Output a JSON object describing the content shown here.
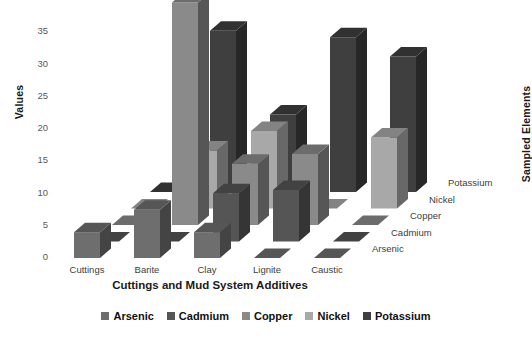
{
  "chart_data": {
    "type": "bar",
    "title": "",
    "subtitle": "",
    "xlabel": "Cuttings and Mud System Additives",
    "ylabel": "Values",
    "zlabel": "Sampled Elements",
    "categories": [
      "Cuttings",
      "Barite",
      "Clay",
      "Lignite",
      "Caustic"
    ],
    "depth_categories": [
      "Arsenic",
      "Cadmium",
      "Copper",
      "Nickel",
      "Potassium"
    ],
    "ylim": [
      0,
      35
    ],
    "yticks": [
      0,
      5,
      10,
      15,
      20,
      25,
      30,
      35
    ],
    "grid": false,
    "legend_position": "bottom",
    "projection": "3d",
    "series": [
      {
        "name": "Arsenic",
        "color": "#6e6e6e",
        "values": [
          4.0,
          7.5,
          4.0,
          0.0,
          0.0
        ]
      },
      {
        "name": "Cadmium",
        "color": "#555555",
        "values": [
          0.0,
          0.0,
          7.5,
          8.0,
          0.0
        ]
      },
      {
        "name": "Copper",
        "color": "#8a8a8a",
        "values": [
          0.0,
          34.5,
          9.5,
          11.0,
          0.0
        ]
      },
      {
        "name": "Nickel",
        "color": "#a8a8a8",
        "values": [
          0.0,
          9.0,
          12.0,
          0.0,
          11.0
        ]
      },
      {
        "name": "Potassium",
        "color": "#3f3f3f",
        "values": [
          0.0,
          25.0,
          12.0,
          24.0,
          21.0
        ]
      }
    ]
  },
  "legend": {
    "items": [
      {
        "label": "Arsenic",
        "color": "#6e6e6e"
      },
      {
        "label": "Cadmium",
        "color": "#555555"
      },
      {
        "label": "Copper",
        "color": "#8a8a8a"
      },
      {
        "label": "Nickel",
        "color": "#a8a8a8"
      },
      {
        "label": "Potassium",
        "color": "#3f3f3f"
      }
    ]
  }
}
